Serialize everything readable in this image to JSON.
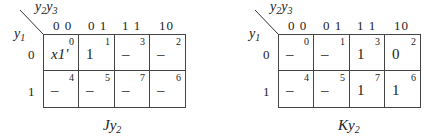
{
  "maps": [
    {
      "name": "Jy2",
      "caption": {
        "main": "Jy",
        "sub": "2"
      },
      "col_var": {
        "a": "y",
        "a_sub": "2",
        "b": "y",
        "b_sub": "3"
      },
      "row_var": {
        "a": "y",
        "a_sub": "1"
      },
      "col_headers": [
        "0 0",
        "0 1",
        "1 1",
        "10"
      ],
      "row_headers": [
        "0",
        "1"
      ],
      "cells": [
        [
          {
            "idx": "0",
            "val": "x1'"
          },
          {
            "idx": "1",
            "val": "1"
          },
          {
            "idx": "3",
            "val": "–"
          },
          {
            "idx": "2",
            "val": "–"
          }
        ],
        [
          {
            "idx": "4",
            "val": "–"
          },
          {
            "idx": "5",
            "val": "–"
          },
          {
            "idx": "7",
            "val": "–"
          },
          {
            "idx": "6",
            "val": "–"
          }
        ]
      ]
    },
    {
      "name": "Ky2",
      "caption": {
        "main": "Ky",
        "sub": "2"
      },
      "col_var": {
        "a": "y",
        "a_sub": "2",
        "b": "y",
        "b_sub": "3"
      },
      "row_var": {
        "a": "y",
        "a_sub": "1"
      },
      "col_headers": [
        "0 0",
        "0 1",
        "1 1",
        "10"
      ],
      "row_headers": [
        "0",
        "1"
      ],
      "cells": [
        [
          {
            "idx": "0",
            "val": "–"
          },
          {
            "idx": "1",
            "val": "–"
          },
          {
            "idx": "3",
            "val": "1"
          },
          {
            "idx": "2",
            "val": "0"
          }
        ],
        [
          {
            "idx": "4",
            "val": "–"
          },
          {
            "idx": "5",
            "val": "–"
          },
          {
            "idx": "7",
            "val": "1"
          },
          {
            "idx": "6",
            "val": "1"
          }
        ]
      ]
    }
  ]
}
